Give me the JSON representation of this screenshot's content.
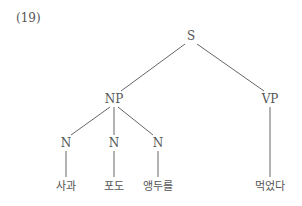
{
  "example_number": "(19)",
  "tree": {
    "nodes": [
      {
        "id": "S",
        "label": "S",
        "x": 191,
        "y": 36
      },
      {
        "id": "NP",
        "label": "NP",
        "x": 114,
        "y": 99
      },
      {
        "id": "VP",
        "label": "VP",
        "x": 270,
        "y": 99
      },
      {
        "id": "N1",
        "label": "N",
        "x": 66,
        "y": 143
      },
      {
        "id": "N2",
        "label": "N",
        "x": 114,
        "y": 143
      },
      {
        "id": "N3",
        "label": "N",
        "x": 158,
        "y": 143
      },
      {
        "id": "W1",
        "label": "사과",
        "x": 66,
        "y": 186,
        "leaf": true
      },
      {
        "id": "W2",
        "label": "포도",
        "x": 114,
        "y": 186,
        "leaf": true
      },
      {
        "id": "W3",
        "label": "앵두를",
        "x": 158,
        "y": 186,
        "leaf": true
      },
      {
        "id": "W4",
        "label": "먹었다",
        "x": 270,
        "y": 186,
        "leaf": true
      }
    ],
    "edges": [
      {
        "from": "S",
        "to": "NP",
        "x1": 185,
        "y1": 44,
        "x2": 121,
        "y2": 91
      },
      {
        "from": "S",
        "to": "VP",
        "x1": 197,
        "y1": 44,
        "x2": 264,
        "y2": 91
      },
      {
        "from": "NP",
        "to": "N1",
        "x1": 110,
        "y1": 107,
        "x2": 71,
        "y2": 135
      },
      {
        "from": "NP",
        "to": "N2",
        "x1": 114,
        "y1": 107,
        "x2": 114,
        "y2": 135
      },
      {
        "from": "NP",
        "to": "N3",
        "x1": 118,
        "y1": 107,
        "x2": 153,
        "y2": 135
      },
      {
        "from": "N1",
        "to": "W1",
        "x1": 66,
        "y1": 151,
        "x2": 66,
        "y2": 177
      },
      {
        "from": "N2",
        "to": "W2",
        "x1": 114,
        "y1": 151,
        "x2": 114,
        "y2": 177
      },
      {
        "from": "N3",
        "to": "W3",
        "x1": 158,
        "y1": 151,
        "x2": 158,
        "y2": 177
      },
      {
        "from": "VP",
        "to": "W4",
        "x1": 270,
        "y1": 107,
        "x2": 270,
        "y2": 177
      }
    ]
  }
}
